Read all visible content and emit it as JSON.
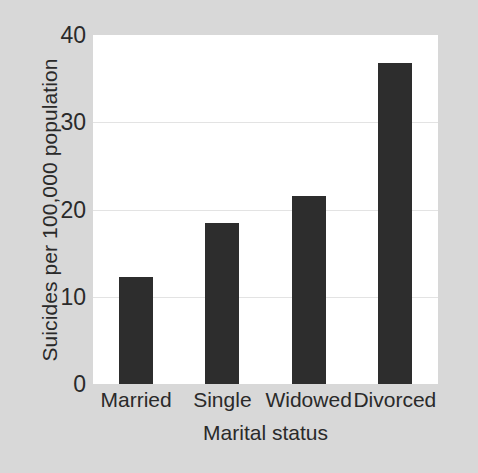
{
  "chart_data": {
    "type": "bar",
    "title": "",
    "subtitle": "",
    "xlabel": "Marital status",
    "ylabel": "Suicides per 100,000 population",
    "categories": [
      "Married",
      "Single",
      "Widowed",
      "Divorced"
    ],
    "values": [
      12.3,
      18.4,
      21.6,
      36.8
    ],
    "ylim": [
      0,
      40
    ],
    "yticks": [
      0,
      10,
      20,
      30,
      40
    ],
    "ytick_labels": [
      "0",
      "10",
      "20",
      "30",
      "40"
    ],
    "gridlines": [
      10,
      20,
      30
    ],
    "grid": true,
    "legend": null,
    "legend_position": "none",
    "annotations": [],
    "colors": {
      "bar": "#2d2d2d",
      "plot_background": "#ffffff",
      "figure_background": "#d8d8d8",
      "gridline": "#e3e3e3",
      "text": "#2a2a2a"
    }
  }
}
